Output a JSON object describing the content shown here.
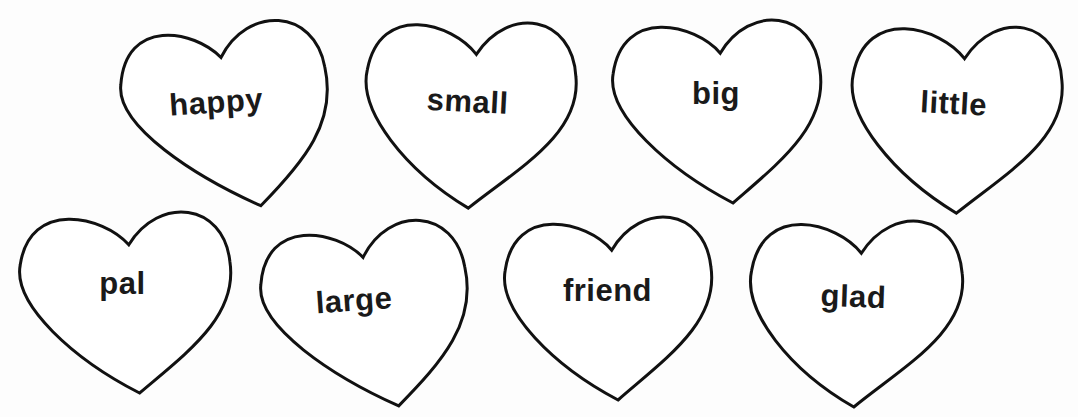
{
  "worksheet": {
    "hearts": [
      {
        "word": "happy",
        "x": 120,
        "y": 22,
        "w": 210,
        "h": 186,
        "rot": -4,
        "dipx": 0.5,
        "tipx": 0.64,
        "texty": 62,
        "textdx": -8
      },
      {
        "word": "small",
        "x": 362,
        "y": 18,
        "w": 214,
        "h": 190,
        "rot": 3,
        "dipx": 0.52,
        "tipx": 0.52,
        "texty": 66,
        "textdx": -2
      },
      {
        "word": "big",
        "x": 610,
        "y": 18,
        "w": 212,
        "h": 185,
        "rot": 0,
        "dipx": 0.52,
        "tipx": 0.58,
        "texty": 58,
        "textdx": 0
      },
      {
        "word": "little",
        "x": 848,
        "y": 22,
        "w": 214,
        "h": 191,
        "rot": 3,
        "dipx": 0.53,
        "tipx": 0.53,
        "texty": 64,
        "textdx": -2
      },
      {
        "word": "pal",
        "x": 17,
        "y": 210,
        "w": 215,
        "h": 183,
        "rot": 0,
        "dipx": 0.52,
        "tipx": 0.57,
        "texty": 56,
        "textdx": -2
      },
      {
        "word": "large",
        "x": 260,
        "y": 222,
        "w": 210,
        "h": 186,
        "rot": -4,
        "dipx": 0.51,
        "tipx": 0.63,
        "texty": 60,
        "textdx": -10
      },
      {
        "word": "friend",
        "x": 502,
        "y": 215,
        "w": 211,
        "h": 185,
        "rot": 0,
        "dipx": 0.52,
        "tipx": 0.55,
        "texty": 58,
        "textdx": 0
      },
      {
        "word": "glad",
        "x": 747,
        "y": 217,
        "w": 216,
        "h": 190,
        "rot": 2,
        "dipx": 0.52,
        "tipx": 0.51,
        "texty": 62,
        "textdx": -2
      }
    ]
  },
  "colors": {
    "outline": "#111111",
    "text": "#1a1a1a",
    "background": "#ffffff"
  }
}
